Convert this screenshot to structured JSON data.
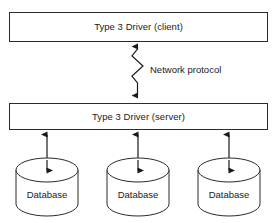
{
  "diagram": {
    "background_color": "#ffffff",
    "stroke_color": "#2b2b2b",
    "text_color": "#1a1a1a",
    "nodes": [
      {
        "id": "client",
        "shape": "rectangle",
        "label": "Type 3 Driver (client)"
      },
      {
        "id": "server",
        "shape": "rectangle",
        "label": "Type 3 Driver (server)"
      }
    ],
    "databases": [
      {
        "id": "database-1",
        "shape": "cylinder",
        "label": "Database"
      },
      {
        "id": "database-2",
        "shape": "cylinder",
        "label": "Database"
      },
      {
        "id": "database-3",
        "shape": "cylinder",
        "label": "Database"
      }
    ],
    "edges": [
      {
        "id": "network-link",
        "from": "server",
        "to": "client",
        "style": "zigzag",
        "arrowheads": "both",
        "label": "Network protocol"
      },
      {
        "id": "server-db-1",
        "from": "server",
        "to": "database-1",
        "style": "straight",
        "arrowheads": "both",
        "label": ""
      },
      {
        "id": "server-db-2",
        "from": "server",
        "to": "database-2",
        "style": "straight",
        "arrowheads": "both",
        "label": ""
      },
      {
        "id": "server-db-3",
        "from": "server",
        "to": "database-3",
        "style": "straight",
        "arrowheads": "both",
        "label": ""
      }
    ]
  }
}
